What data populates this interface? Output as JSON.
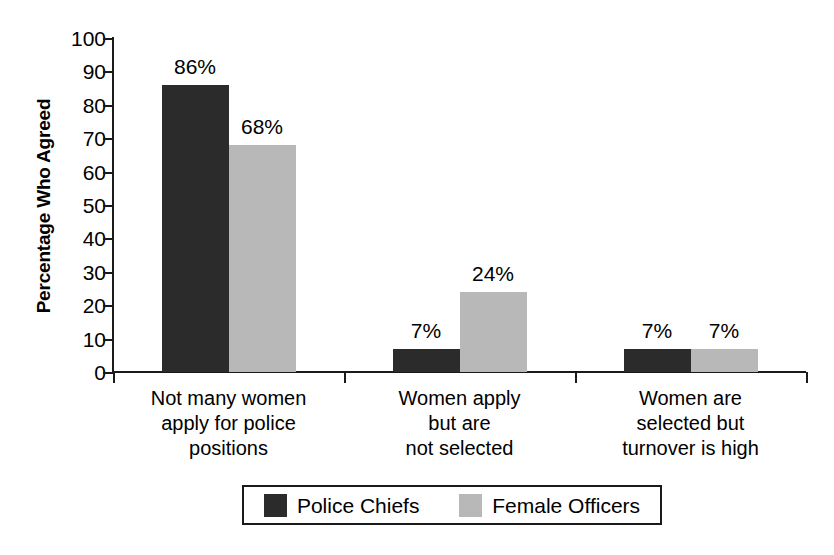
{
  "chart_data": {
    "type": "bar",
    "title": "",
    "subtitle": "",
    "xlabel": "",
    "ylabel": "Percentage Who Agreed",
    "ylim": [
      0,
      100
    ],
    "ytick_step": 10,
    "yticks": [
      "100",
      "90",
      "80",
      "70",
      "60",
      "50",
      "40",
      "30",
      "20",
      "10",
      "0"
    ],
    "grid": false,
    "legend_position": "bottom",
    "categories": [
      "Not many women\napply for police\npositions",
      "Women apply\nbut are\nnot selected",
      "Women are\nselected but\nturnover is high"
    ],
    "category_lines": [
      [
        "Not many women",
        "apply for police",
        "positions"
      ],
      [
        "Women apply",
        "but are",
        "not selected"
      ],
      [
        "Women are",
        "selected but",
        "turnover is high"
      ]
    ],
    "series": [
      {
        "name": "Police Chiefs",
        "color": "#2b2b2b",
        "values": [
          86,
          7,
          7
        ],
        "labels": [
          "86%",
          "7%",
          "7%"
        ]
      },
      {
        "name": "Female Officers",
        "color": "#b8b8b8",
        "values": [
          68,
          24,
          7
        ],
        "labels": [
          "68%",
          "24%",
          "7%"
        ]
      }
    ]
  },
  "legend": {
    "items": [
      {
        "label": "Police Chiefs",
        "color": "#2b2b2b"
      },
      {
        "label": "Female Officers",
        "color": "#b8b8b8"
      }
    ]
  }
}
